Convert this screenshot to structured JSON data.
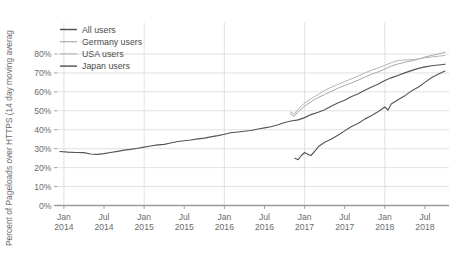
{
  "chart_data": {
    "type": "line",
    "title": "",
    "xlabel": "",
    "ylabel": "Percent of Pageloads over HTTPS (14 day moving averag",
    "ylim": [
      0,
      85
    ],
    "ytick_labels": [
      "0%",
      "10%",
      "20%",
      "30%",
      "40%",
      "50%",
      "60%",
      "70%",
      "80%"
    ],
    "ytick_values": [
      0,
      10,
      20,
      30,
      40,
      50,
      60,
      70,
      80
    ],
    "xtick_labels": [
      [
        "Jan",
        "2014"
      ],
      [
        "Jul",
        "2014"
      ],
      [
        "Jan",
        "2015"
      ],
      [
        "Jul",
        "2015"
      ],
      [
        "Jan",
        "2016"
      ],
      [
        "Jul",
        "2016"
      ],
      [
        "Jan",
        "2017"
      ],
      [
        "Jul",
        "2017"
      ],
      [
        "Jan",
        "2018"
      ],
      [
        "Jul",
        "2018"
      ]
    ],
    "xlim": [
      "2013-11",
      "2018-10"
    ],
    "grid": true,
    "legend_position": "top-left",
    "series": [
      {
        "name": "All users",
        "color": "#555555",
        "x": [
          2013.95,
          2014.05,
          2014.15,
          2014.25,
          2014.33,
          2014.42,
          2014.5,
          2014.58,
          2014.67,
          2014.75,
          2014.83,
          2014.92,
          2015.0,
          2015.08,
          2015.17,
          2015.25,
          2015.33,
          2015.42,
          2015.5,
          2015.58,
          2015.67,
          2015.75,
          2015.83,
          2015.92,
          2016.0,
          2016.08,
          2016.17,
          2016.25,
          2016.33,
          2016.42,
          2016.5,
          2016.58,
          2016.67,
          2016.75,
          2016.83,
          2016.92,
          2017.0,
          2017.08,
          2017.17,
          2017.25,
          2017.33,
          2017.42,
          2017.5,
          2017.58,
          2017.67,
          2017.75,
          2017.83,
          2017.92,
          2018.0,
          2018.08,
          2018.17,
          2018.25,
          2018.33,
          2018.42,
          2018.5,
          2018.58,
          2018.67,
          2018.75
        ],
        "values": [
          28.5,
          28.2,
          28.0,
          27.9,
          27.2,
          27.0,
          27.4,
          28.0,
          28.6,
          29.2,
          29.6,
          30.2,
          30.8,
          31.4,
          32.0,
          32.3,
          33.0,
          33.8,
          34.2,
          34.6,
          35.2,
          35.6,
          36.2,
          36.9,
          37.6,
          38.4,
          38.8,
          39.2,
          39.6,
          40.4,
          41.0,
          41.6,
          42.6,
          43.8,
          44.6,
          45.2,
          46.4,
          48.0,
          49.2,
          50.6,
          52.4,
          54.2,
          55.6,
          57.4,
          59.0,
          60.8,
          62.4,
          64.2,
          66.0,
          67.4,
          68.8,
          70.0,
          71.2,
          72.4,
          73.2,
          73.8,
          74.2,
          74.6
        ]
      },
      {
        "name": "Germany users",
        "color": "#a8a8a8",
        "x": [
          2016.82,
          2016.87,
          2016.92,
          2016.96,
          2017.0,
          2017.08,
          2017.17,
          2017.25,
          2017.33,
          2017.42,
          2017.5,
          2017.58,
          2017.67,
          2017.75,
          2017.83,
          2017.92,
          2018.0,
          2018.08,
          2018.17,
          2018.25,
          2018.33,
          2018.42,
          2018.5,
          2018.58,
          2018.67,
          2018.75
        ],
        "values": [
          48.5,
          47.0,
          49.5,
          51.0,
          52.4,
          54.8,
          57.0,
          58.6,
          60.2,
          62.0,
          63.4,
          64.6,
          66.2,
          67.8,
          69.2,
          70.6,
          72.0,
          73.6,
          74.8,
          75.6,
          76.4,
          77.2,
          78.4,
          79.2,
          80.0,
          81.0
        ]
      },
      {
        "name": "USA users",
        "color": "#b4b4b4",
        "x": [
          2016.82,
          2016.87,
          2016.92,
          2016.96,
          2017.0,
          2017.08,
          2017.17,
          2017.25,
          2017.33,
          2017.42,
          2017.5,
          2017.58,
          2017.67,
          2017.75,
          2017.83,
          2017.92,
          2018.0,
          2018.08,
          2018.17,
          2018.25,
          2018.33,
          2018.42,
          2018.5,
          2018.58,
          2018.67,
          2018.75
        ],
        "values": [
          49.5,
          48.2,
          50.8,
          52.6,
          54.0,
          56.4,
          58.6,
          60.8,
          62.4,
          64.0,
          65.4,
          66.8,
          68.4,
          70.0,
          71.4,
          72.6,
          74.0,
          75.4,
          76.6,
          76.8,
          77.0,
          77.4,
          78.0,
          78.4,
          78.8,
          79.2
        ]
      },
      {
        "name": "Japan users",
        "color": "#585858",
        "x": [
          2016.88,
          2016.92,
          2016.96,
          2017.0,
          2017.04,
          2017.08,
          2017.13,
          2017.17,
          2017.25,
          2017.33,
          2017.42,
          2017.5,
          2017.58,
          2017.67,
          2017.75,
          2017.83,
          2017.92,
          2018.0,
          2018.04,
          2018.08,
          2018.17,
          2018.25,
          2018.33,
          2018.42,
          2018.5,
          2018.58,
          2018.67,
          2018.75
        ],
        "values": [
          25.0,
          24.2,
          26.4,
          28.0,
          27.0,
          26.4,
          28.8,
          31.0,
          33.4,
          35.0,
          37.2,
          39.4,
          41.6,
          43.4,
          45.6,
          47.4,
          49.6,
          52.0,
          50.4,
          53.6,
          56.0,
          58.0,
          60.4,
          62.6,
          65.0,
          67.4,
          69.4,
          71.0
        ]
      }
    ]
  },
  "legend": {
    "items": [
      {
        "label": "All users"
      },
      {
        "label": "Germany users"
      },
      {
        "label": "USA users"
      },
      {
        "label": "Japan users"
      }
    ]
  }
}
